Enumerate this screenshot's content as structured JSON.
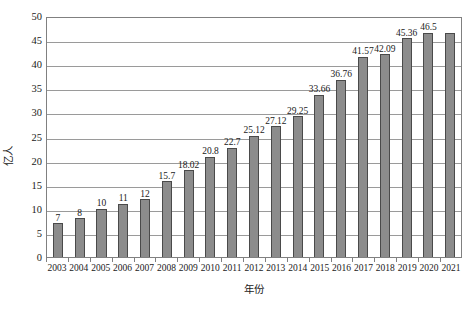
{
  "chart_data": {
    "type": "bar",
    "title": "",
    "subtitle": "",
    "xlabel": "年份",
    "ylabel": "亿人",
    "ylim": [
      0,
      50
    ],
    "ytick_step": 5,
    "yticks": [
      50,
      45,
      40,
      35,
      30,
      25,
      20,
      15,
      10,
      5,
      0
    ],
    "ytick_labels": [
      "50",
      "45",
      "40",
      "35",
      "30",
      "25",
      "20",
      "15",
      "10",
      "5",
      "0"
    ],
    "grid": "horizontal",
    "legend": "none",
    "categories": [
      "2003",
      "2004",
      "2005",
      "2006",
      "2007",
      "2008",
      "2009",
      "2010",
      "2011",
      "2012",
      "2013",
      "2014",
      "2015",
      "2016",
      "2017",
      "2018",
      "2019",
      "2020",
      "2021"
    ],
    "values": [
      7,
      8,
      10,
      11,
      12,
      15.7,
      18.02,
      20.8,
      22.7,
      25.12,
      27.12,
      29.25,
      33.66,
      36.76,
      41.57,
      42.09,
      45.36,
      46.5,
      46.5
    ],
    "data_labels": [
      "7",
      "8",
      "10",
      "11",
      "12",
      "15.7",
      "18.02",
      "20.8",
      "22.7",
      "25.12",
      "27.12",
      "29.25",
      "33.66",
      "36.76",
      "41.57",
      "42.09",
      "45.36",
      "46.5",
      ""
    ],
    "series": [
      {
        "name": "亿人",
        "values": [
          7,
          8,
          10,
          11,
          12,
          15.7,
          18.02,
          20.8,
          22.7,
          25.12,
          27.12,
          29.25,
          33.66,
          36.76,
          41.57,
          42.09,
          45.36,
          46.5,
          46.5
        ]
      }
    ],
    "colors": {
      "bar_fill": "#8c8c8c",
      "bar_stroke": "#4a4a4a",
      "gridline": "#9a9a9a",
      "axis": "#808080",
      "background": "#ffffff",
      "text": "#1a1a1a"
    }
  }
}
